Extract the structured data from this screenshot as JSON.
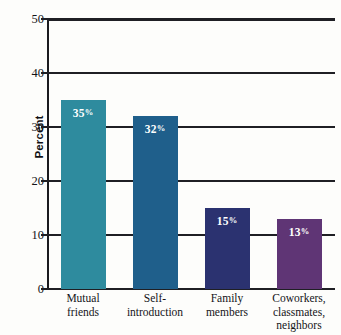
{
  "chart_data": {
    "type": "bar",
    "title": "",
    "subtitle": "",
    "xlabel": "",
    "ylabel": "Percent",
    "ylim": [
      0,
      50
    ],
    "ytick_labels": [
      "50",
      "40",
      "30",
      "20",
      "10",
      "0"
    ],
    "yticks": [
      50,
      40,
      30,
      20,
      10,
      0
    ],
    "grid": "horizontal",
    "legend": "none",
    "categories": [
      "Mutual friends",
      "Self-introduction",
      "Family members",
      "Coworkers, classmates, neighbors"
    ],
    "category_lines": [
      [
        "Mutual",
        "friends"
      ],
      [
        "Self-",
        "introduction"
      ],
      [
        "Family",
        "members"
      ],
      [
        "Coworkers,",
        "classmates,",
        "neighbors"
      ]
    ],
    "values": [
      35,
      32,
      15,
      13
    ],
    "data_labels": [
      "35",
      "32",
      "15",
      "13"
    ],
    "data_label_suffix": "%",
    "bar_colors": [
      "#2e8b9e",
      "#1f5f8b",
      "#2b3270",
      "#5f3575"
    ]
  },
  "axis": {
    "y_title": "Percent",
    "axis_color": "#1f1f24"
  }
}
